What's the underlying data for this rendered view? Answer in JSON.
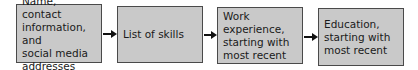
{
  "diagram": {
    "type": "flowchart",
    "direction": "left-to-right",
    "colors": {
      "box_fill": "#c9c9c9",
      "box_border": "#4a4a4a",
      "arrow": "#111111",
      "text": "#1a1a1a"
    },
    "nodes": [
      {
        "id": "contact",
        "label": "Name, contact\ninformation, and\nsocial media\naddresses"
      },
      {
        "id": "skills",
        "label": "List of skills"
      },
      {
        "id": "work",
        "label": "Work experience,\nstarting with\nmost recent"
      },
      {
        "id": "education",
        "label": "Education,\nstarting with\nmost recent"
      }
    ],
    "edges": [
      {
        "from": "contact",
        "to": "skills"
      },
      {
        "from": "skills",
        "to": "work"
      },
      {
        "from": "work",
        "to": "education"
      }
    ]
  }
}
